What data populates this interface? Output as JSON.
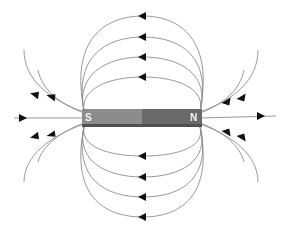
{
  "diagram": {
    "type": "magnetic-field-lines",
    "magnet": {
      "south_label": "S",
      "north_label": "N",
      "south_color": "#8c8c8c",
      "north_color": "#6a6a6a",
      "edge_color": "#505050"
    },
    "field_line_color": "#8c8c8c",
    "arrow_color": "#111111",
    "top_loops": 4,
    "bottom_loops": 4,
    "side_lines_each_end": 5,
    "arrow_direction": "north to south outside magnet"
  }
}
